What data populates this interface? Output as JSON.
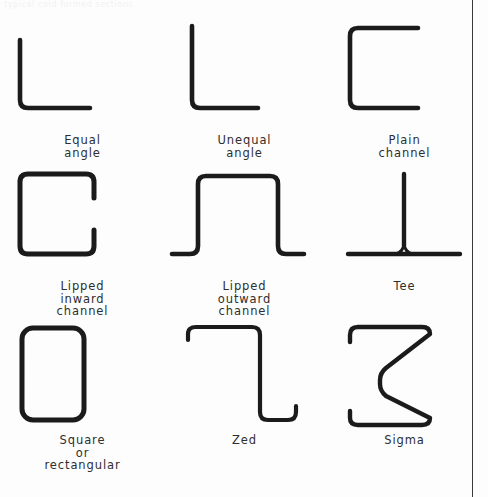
{
  "page": {
    "background_color": "#fdfdfd",
    "stroke_color": "#1b1b1b",
    "text_color": "#2e2e2e",
    "rule_color": "#3a3a3a",
    "top_fragment": "typical cold formed sections"
  },
  "diagram": {
    "type": "technical-illustration",
    "columns": 3,
    "rows": 3,
    "sections": [
      {
        "id": "equal-angle",
        "label": "Equal\nangle",
        "row": 1,
        "col": 1
      },
      {
        "id": "unequal-angle",
        "label": "Unequal\nangle",
        "row": 1,
        "col": 2
      },
      {
        "id": "plain-channel",
        "label": "Plain\nchannel",
        "row": 1,
        "col": 3
      },
      {
        "id": "lipped-inward-channel",
        "label": "Lipped\ninward\nchannel",
        "row": 2,
        "col": 1
      },
      {
        "id": "lipped-outward-channel",
        "label": "Lipped\noutward\nchannel",
        "row": 2,
        "col": 2
      },
      {
        "id": "tee",
        "label": "Tee",
        "row": 2,
        "col": 3
      },
      {
        "id": "square-or-rectangular",
        "label": "Square\nor\nrectangular",
        "row": 3,
        "col": 1
      },
      {
        "id": "zed",
        "label": "Zed",
        "row": 3,
        "col": 2
      },
      {
        "id": "sigma",
        "label": "Sigma",
        "row": 3,
        "col": 3
      }
    ]
  }
}
